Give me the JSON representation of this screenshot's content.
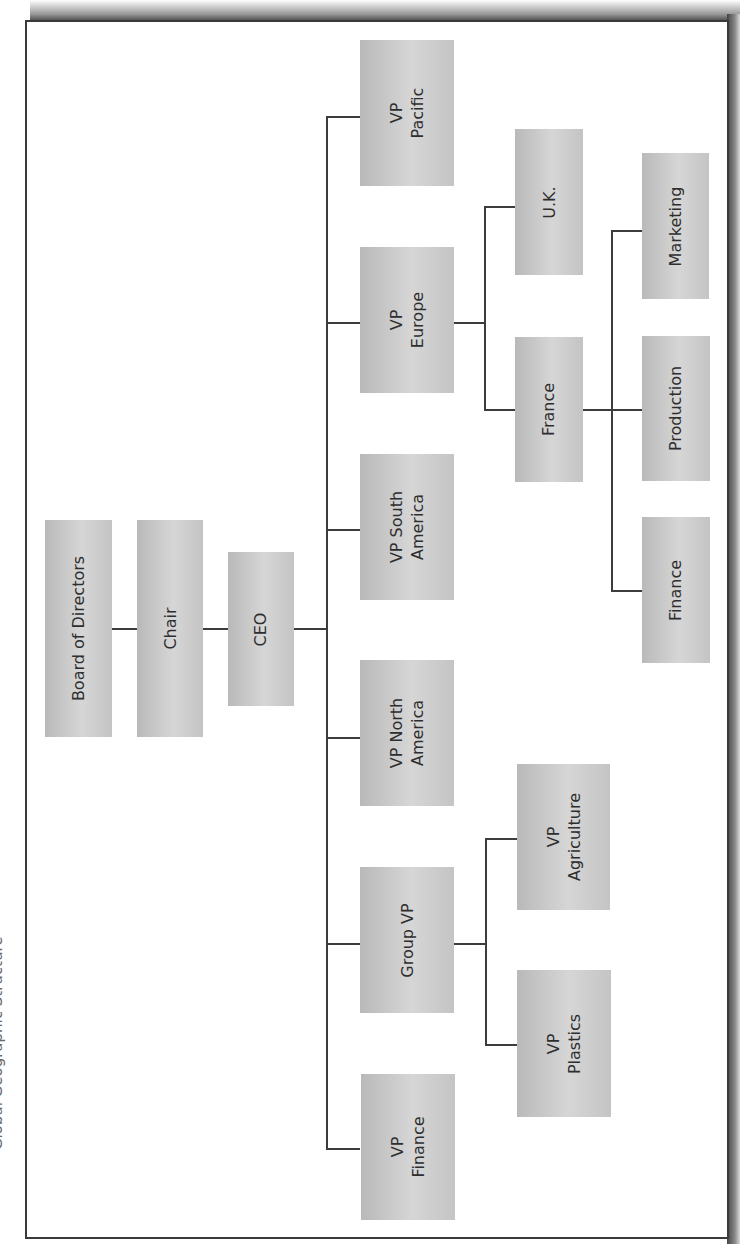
{
  "caption": "Global Geographic Structure",
  "chart": {
    "type": "org-chart",
    "orientation": "rotated-90-ccw",
    "nodes": {
      "board": "Board of Directors",
      "chair": "Chair",
      "ceo": "CEO",
      "vp_pacific": "VP\nPacific",
      "vp_europe": "VP\nEurope",
      "vp_south_america": "VP South\nAmerica",
      "vp_north_america": "VP North\nAmerica",
      "group_vp": "Group VP",
      "vp_finance": "VP\nFinance",
      "uk": "U.K.",
      "france": "France",
      "marketing": "Marketing",
      "production": "Production",
      "finance": "Finance",
      "vp_agriculture": "VP\nAgriculture",
      "vp_plastics": "VP\nPlastics"
    },
    "hierarchy": {
      "Board of Directors": [
        "Chair"
      ],
      "Chair": [
        "CEO"
      ],
      "CEO": [
        "VP Pacific",
        "VP Europe",
        "VP South America",
        "VP North America",
        "Group VP",
        "VP Finance"
      ],
      "VP Europe": [
        "U.K.",
        "France"
      ],
      "France": [
        "Marketing",
        "Production",
        "Finance"
      ],
      "Group VP": [
        "VP Agriculture",
        "VP Plastics"
      ]
    },
    "colors": {
      "box_fill": "#c8c8c8",
      "line": "#3c3c3c",
      "text": "#2e2e2e",
      "frame": "#3a3a3a"
    }
  }
}
